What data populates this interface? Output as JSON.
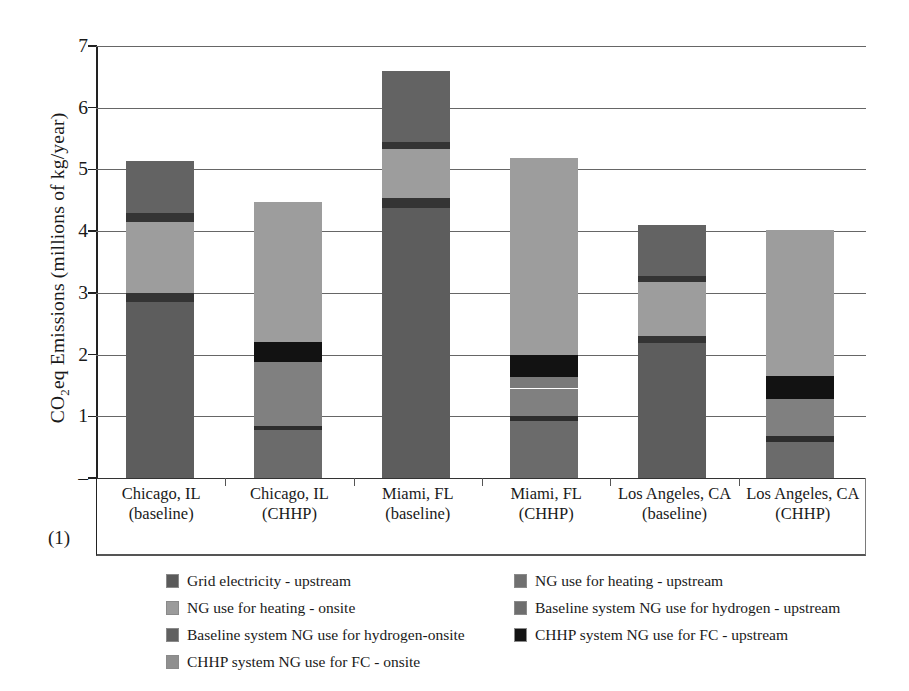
{
  "axis": {
    "ylabel_main": "CO",
    "ylabel_sub": "2",
    "ylabel_rest": "eq Emissions (millions of kg/year)",
    "yticks": [
      "7",
      "6",
      "5",
      "4",
      "3",
      "2",
      "1",
      "–"
    ],
    "zero_dash": "–",
    "note": "(1)"
  },
  "legend": {
    "items": [
      {
        "label": "Grid electricity - upstream",
        "color": "#5a5a5a",
        "col": 0,
        "row": 0
      },
      {
        "label": "NG use for heating - upstream",
        "color": "#707070",
        "col": 1,
        "row": 0
      },
      {
        "label": "NG use for heating - onsite",
        "color": "#9b9b9b",
        "col": 0,
        "row": 1
      },
      {
        "label": "Baseline system NG use for hydrogen - upstream",
        "color": "#6e6e6e",
        "col": 1,
        "row": 1
      },
      {
        "label": "Baseline system NG use for hydrogen-onsite",
        "color": "#606060",
        "col": 0,
        "row": 2
      },
      {
        "label": "CHHP system NG use for FC - upstream",
        "color": "#141414",
        "col": 1,
        "row": 2
      },
      {
        "label": "CHHP system NG use for FC - onsite",
        "color": "#8f8f8f",
        "col": 0,
        "row": 3
      }
    ]
  },
  "chart_data": {
    "type": "bar",
    "subtype": "stacked",
    "title": "",
    "xlabel": "",
    "ylabel": "CO2eq Emissions (millions of kg/year)",
    "ylim": [
      0,
      7
    ],
    "ytick_values": [
      0,
      1,
      2,
      3,
      4,
      5,
      6,
      7
    ],
    "grid": true,
    "legend_position": "bottom",
    "categories": [
      "Chicago, IL (baseline)",
      "Chicago, IL (CHHP)",
      "Miami, FL (baseline)",
      "Miami, FL (CHHP)",
      "Los Angeles, CA (baseline)",
      "Los Angeles, CA (CHHP)"
    ],
    "category_lines": [
      [
        "Chicago, IL",
        "(baseline)"
      ],
      [
        "Chicago, IL",
        "(CHHP)"
      ],
      [
        "Miami, FL",
        "(baseline)"
      ],
      [
        "Miami, FL",
        "(CHHP)"
      ],
      [
        "Los Angeles, CA",
        "(baseline)"
      ],
      [
        "Los Angeles, CA",
        "(CHHP)"
      ]
    ],
    "series": [
      {
        "name": "Grid electricity - upstream",
        "color": "#5a5a5a",
        "values": [
          2.85,
          0.0,
          4.38,
          0.0,
          2.18,
          0.0
        ]
      },
      {
        "name": "NG use for heating - upstream",
        "color": "#3a3a3a",
        "values": [
          0.15,
          0.0,
          0.12,
          0.0,
          0.12,
          0.0
        ]
      },
      {
        "name": "NG use for heating - onsite",
        "color": "#9b9b9b",
        "values": [
          1.15,
          0.0,
          0.8,
          0.0,
          0.88,
          0.0
        ]
      },
      {
        "name": "Baseline system NG use for hydrogen - upstream",
        "color": "#3a3a3a",
        "values": [
          0.15,
          0.0,
          0.15,
          0.0,
          0.09,
          0.0
        ]
      },
      {
        "name": "Baseline system NG use for hydrogen-onsite",
        "color": "#606060",
        "values": [
          0.83,
          0.0,
          1.15,
          0.0,
          0.83,
          0.0
        ]
      },
      {
        "name": "CHHP onsite NG lower block",
        "color": "#6a6a6a",
        "values": [
          0.0,
          0.77,
          0.0,
          0.93,
          0.0,
          0.58
        ]
      },
      {
        "name": "CHHP thin divider",
        "color": "#2b2b2b",
        "values": [
          0.0,
          0.08,
          0.0,
          0.07,
          0.0,
          0.1
        ]
      },
      {
        "name": "CHHP mid gray block",
        "color": "#7e7e7e",
        "values": [
          0.0,
          1.03,
          0.0,
          0.45,
          0.0,
          0.6
        ]
      },
      {
        "name": "CHHP system NG use for FC - upstream",
        "color": "#141414",
        "values": [
          0.0,
          0.32,
          0.0,
          0.37,
          0.0,
          0.37
        ]
      },
      {
        "name": "CHHP system NG use for FC - onsite",
        "color": "#9b9b9b",
        "values": [
          0.0,
          2.27,
          0.0,
          3.19,
          0.0,
          2.37
        ]
      }
    ],
    "totals": [
      5.13,
      4.47,
      6.6,
      5.19,
      4.1,
      4.02
    ]
  },
  "bars": [
    {
      "name": "chicago-baseline",
      "left": 30,
      "total": 5.13,
      "segments": [
        {
          "from": 0.0,
          "to": 2.85,
          "color": "#5d5d5d"
        },
        {
          "from": 2.85,
          "to": 3.0,
          "color": "#343434"
        },
        {
          "from": 3.0,
          "to": 4.15,
          "color": "#9d9d9d"
        },
        {
          "from": 4.15,
          "to": 4.3,
          "color": "#343434"
        },
        {
          "from": 4.3,
          "to": 5.13,
          "color": "#636363"
        }
      ]
    },
    {
      "name": "chicago-chhp",
      "left": 158,
      "total": 4.47,
      "segments": [
        {
          "from": 0.0,
          "to": 0.77,
          "color": "#6b6b6b"
        },
        {
          "from": 0.77,
          "to": 0.85,
          "color": "#2d2d2d"
        },
        {
          "from": 0.85,
          "to": 1.88,
          "color": "#808080"
        },
        {
          "from": 1.88,
          "to": 2.2,
          "color": "#121212"
        },
        {
          "from": 2.2,
          "to": 4.47,
          "color": "#9d9d9d"
        }
      ]
    },
    {
      "name": "miami-baseline",
      "left": 286,
      "total": 6.6,
      "segments": [
        {
          "from": 0.0,
          "to": 4.38,
          "color": "#5d5d5d"
        },
        {
          "from": 4.38,
          "to": 4.53,
          "color": "#343434"
        },
        {
          "from": 4.53,
          "to": 5.33,
          "color": "#9d9d9d"
        },
        {
          "from": 5.33,
          "to": 5.45,
          "color": "#343434"
        },
        {
          "from": 5.45,
          "to": 6.6,
          "color": "#636363"
        }
      ]
    },
    {
      "name": "miami-chhp",
      "left": 414,
      "total": 5.19,
      "segments": [
        {
          "from": 0.0,
          "to": 0.93,
          "color": "#6b6b6b"
        },
        {
          "from": 0.93,
          "to": 1.0,
          "color": "#2d2d2d"
        },
        {
          "from": 1.0,
          "to": 1.45,
          "color": "#808080"
        },
        {
          "from": 1.45,
          "to": 1.63,
          "color": "#7a7a7a"
        },
        {
          "from": 1.63,
          "to": 2.0,
          "color": "#121212"
        },
        {
          "from": 2.0,
          "to": 5.19,
          "color": "#9d9d9d"
        }
      ]
    },
    {
      "name": "la-baseline",
      "left": 542,
      "total": 4.1,
      "segments": [
        {
          "from": 0.0,
          "to": 2.18,
          "color": "#5d5d5d"
        },
        {
          "from": 2.18,
          "to": 2.3,
          "color": "#343434"
        },
        {
          "from": 2.3,
          "to": 3.18,
          "color": "#9d9d9d"
        },
        {
          "from": 3.18,
          "to": 3.27,
          "color": "#343434"
        },
        {
          "from": 3.27,
          "to": 4.1,
          "color": "#636363"
        }
      ]
    },
    {
      "name": "la-chhp",
      "left": 670,
      "total": 4.02,
      "segments": [
        {
          "from": 0.0,
          "to": 0.58,
          "color": "#6b6b6b"
        },
        {
          "from": 0.58,
          "to": 0.68,
          "color": "#2d2d2d"
        },
        {
          "from": 0.68,
          "to": 1.28,
          "color": "#808080"
        },
        {
          "from": 1.28,
          "to": 1.65,
          "color": "#121212"
        },
        {
          "from": 1.65,
          "to": 4.02,
          "color": "#9d9d9d"
        }
      ]
    }
  ]
}
